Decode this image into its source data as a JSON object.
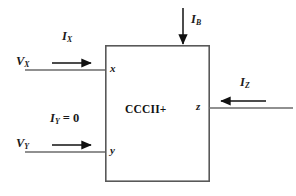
{
  "diagram": {
    "type": "circuit-block-diagram",
    "block": {
      "label": "CCCII+",
      "x": 105,
      "y": 45,
      "width": 105,
      "height": 137,
      "stroke": "#595959",
      "fill": "#ffffff",
      "stroke_width": 1.6
    },
    "terminals": [
      {
        "name": "x",
        "label": "x",
        "side": "left",
        "cx": 112,
        "cy": 70
      },
      {
        "name": "y",
        "label": "y",
        "side": "left",
        "cx": 112,
        "cy": 152
      },
      {
        "name": "z",
        "label": "z",
        "side": "right",
        "cx": 203,
        "cy": 108
      }
    ],
    "signals": [
      {
        "name": "vx",
        "label": "V",
        "sub": "X",
        "kind": "voltage",
        "label_x": 16,
        "label_y": 62,
        "wire": {
          "x1": 25,
          "y1": 70,
          "x2": 105,
          "y2": 70
        }
      },
      {
        "name": "vy",
        "label": "V",
        "sub": "Y",
        "kind": "voltage",
        "label_x": 16,
        "label_y": 144,
        "wire": {
          "x1": 25,
          "y1": 152,
          "x2": 105,
          "y2": 152
        }
      },
      {
        "name": "ix",
        "label": "I",
        "sub": "X",
        "kind": "current",
        "label_x": 62,
        "label_y": 28,
        "arrow": {
          "x1": 52,
          "y1": 63,
          "x2": 92,
          "y2": 63,
          "dir": "right"
        }
      },
      {
        "name": "iy",
        "label": "I",
        "sub": "Y",
        "suffix": " = 0",
        "kind": "current",
        "label_x": 50,
        "label_y": 113,
        "arrow": {
          "x1": 52,
          "y1": 145,
          "x2": 92,
          "y2": 145,
          "dir": "right"
        }
      },
      {
        "name": "ib",
        "label": "I",
        "sub": "B",
        "kind": "current",
        "label_x": 192,
        "label_y": 17,
        "arrow": {
          "x1": 183,
          "y1": 8,
          "x2": 183,
          "y2": 45,
          "dir": "down"
        }
      },
      {
        "name": "iz",
        "label": "I",
        "sub": "Z",
        "kind": "current",
        "label_x": 243,
        "label_y": 80,
        "arrow": {
          "x1": 265,
          "y1": 101,
          "x2": 220,
          "y2": 101,
          "dir": "left"
        },
        "wire": {
          "x1": 210,
          "y1": 108,
          "x2": 292,
          "y2": 108
        }
      }
    ],
    "line_color": "#6b6b6b",
    "arrow_color": "#111111"
  }
}
